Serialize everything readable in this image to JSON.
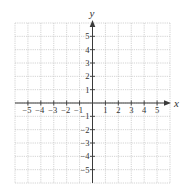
{
  "chart_data": {
    "type": "scatter",
    "title": "",
    "xlabel": "x",
    "ylabel": "y",
    "xlim": [
      -6,
      6
    ],
    "ylim": [
      -6,
      6
    ],
    "grid": true,
    "x_ticks": [
      -5,
      -4,
      -3,
      -2,
      -1,
      1,
      2,
      3,
      4,
      5
    ],
    "y_ticks": [
      -5,
      -4,
      -3,
      -2,
      -1,
      1,
      2,
      3,
      4,
      5
    ],
    "x_tick_labels": [
      "−5",
      "−4",
      "−3",
      "−2",
      "−1",
      "1",
      "2",
      "3",
      "4",
      "5"
    ],
    "y_tick_labels": [
      "−5",
      "−4",
      "−3",
      "−2",
      "−1",
      "1",
      "2",
      "3",
      "4",
      "5"
    ],
    "series": [],
    "legend": null
  },
  "axes": {
    "x_title": "x",
    "y_title": "y"
  },
  "colors": {
    "grid": "#c8c8c8",
    "axis": "#3a3a3a",
    "text": "#333333"
  },
  "layout": {
    "grid_left": 15,
    "grid_right": 170,
    "grid_top": 23,
    "grid_bottom": 183,
    "origin_x": 92.5,
    "origin_y": 103
  }
}
